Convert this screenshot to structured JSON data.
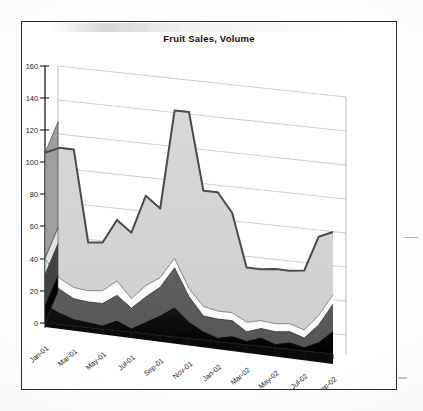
{
  "chart": {
    "title": "Fruit Sales, Volume",
    "frame_border_color": "#2a2a2a",
    "plot_background": "#ffffff"
  },
  "chart_data": {
    "type": "area",
    "stacked": true,
    "three_d": true,
    "title": "Fruit Sales, Volume",
    "xlabel": "",
    "ylabel": "",
    "ylim": [
      0,
      160
    ],
    "ytick_step": 20,
    "yticks": [
      0,
      20,
      40,
      60,
      80,
      100,
      120,
      140,
      160
    ],
    "grid": true,
    "legend": "none",
    "x": [
      "Jan-01",
      "Feb-01",
      "Mar-01",
      "Apr-01",
      "May-01",
      "Jun-01",
      "Jul-01",
      "Aug-01",
      "Sep-01",
      "Oct-01",
      "Nov-01",
      "Dec-01",
      "Jan-02",
      "Feb-02",
      "Mar-02",
      "Apr-02",
      "May-02",
      "Jun-02",
      "Jul-02",
      "Aug-02",
      "Sep-02"
    ],
    "xtick_labels": [
      "Jan-01",
      "Mar-01",
      "May-01",
      "Jul-01",
      "Sep-01",
      "Nov-01",
      "Jan-02",
      "Mar-02",
      "May-02",
      "Jul-02",
      "Sep-02"
    ],
    "series": [
      {
        "name": "Series 1",
        "color": "#0b0b0b",
        "values": [
          11,
          7,
          4,
          3,
          2,
          6,
          2,
          7,
          12,
          18,
          10,
          5,
          2,
          4,
          2,
          5,
          2,
          4,
          2,
          6,
          14
        ]
      },
      {
        "name": "Series 2",
        "color": "#595959",
        "values": [
          19,
          15,
          13,
          13,
          14,
          16,
          13,
          16,
          18,
          25,
          16,
          10,
          12,
          10,
          6,
          6,
          8,
          7,
          6,
          11,
          17
        ]
      },
      {
        "name": "Series 3",
        "color": "#fafafa",
        "values": [
          10,
          7,
          7,
          7,
          8,
          9,
          6,
          7,
          6,
          6,
          5,
          6,
          5,
          5,
          6,
          5,
          5,
          5,
          5,
          6,
          6
        ]
      },
      {
        "name": "Series 4",
        "color": "#d4d4d4",
        "values": [
          66,
          81,
          86,
          30,
          30,
          38,
          41,
          56,
          43,
          92,
          110,
          72,
          74,
          62,
          34,
          32,
          34,
          33,
          37,
          49,
          39
        ]
      }
    ],
    "totals": [
      106,
      110,
      110,
      53,
      54,
      69,
      62,
      86,
      79,
      141,
      141,
      93,
      93,
      81,
      48,
      48,
      49,
      49,
      50,
      72,
      76
    ]
  },
  "axis": {
    "y_tick_labels": [
      "160",
      "140",
      "120",
      "100",
      "80",
      "60",
      "40",
      "20",
      "0"
    ],
    "x_tick_labels": [
      "Jan-01",
      "Mar-01",
      "May-01",
      "Jul-01",
      "Sep-01",
      "Nov-01",
      "Jan-02",
      "Mar-02",
      "May-02",
      "Jul-02",
      "Sep-02"
    ]
  }
}
